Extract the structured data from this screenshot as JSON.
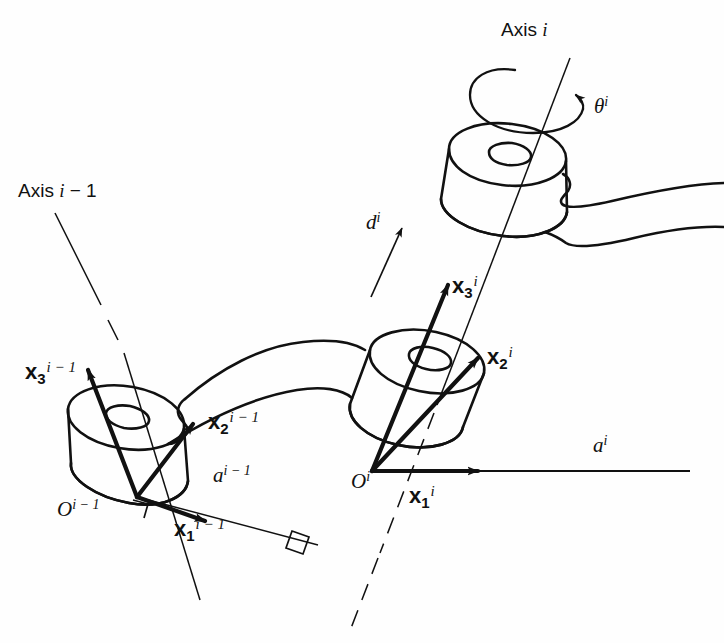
{
  "figure": {
    "type": "diagram",
    "stroke_color": "#111111",
    "background_color": "#fefefe"
  },
  "labels": {
    "axis_prev": {
      "text_prefix": "Axis ",
      "symbol": "i",
      "suffix": " − 1",
      "full": "Axis i − 1"
    },
    "axis_curr": {
      "text_prefix": "Axis ",
      "symbol": "i",
      "suffix": "",
      "full": "Axis i"
    },
    "theta": {
      "glyph": "θ",
      "sup": "i",
      "full": "θⁱ"
    },
    "d_offset": {
      "glyph": "d",
      "sup": "i",
      "full": "dⁱ"
    },
    "a_prev": {
      "glyph": "a",
      "sup": "i − 1",
      "full": "aⁱ⁻¹"
    },
    "a_curr": {
      "glyph": "a",
      "sup": "i",
      "full": "aⁱ"
    },
    "origin_prev": {
      "glyph": "O",
      "sup": "i − 1",
      "full": "Oⁱ⁻¹"
    },
    "origin_curr": {
      "glyph": "O",
      "sup": "i",
      "full": "Oⁱ"
    },
    "x1_prev": {
      "glyph": "x",
      "sub": "1",
      "sup": "i − 1"
    },
    "x2_prev": {
      "glyph": "x",
      "sub": "2",
      "sup": "i − 1"
    },
    "x3_prev": {
      "glyph": "x",
      "sub": "3",
      "sup": "i − 1"
    },
    "x1_curr": {
      "glyph": "x",
      "sub": "1",
      "sup": "i"
    },
    "x2_curr": {
      "glyph": "x",
      "sub": "2",
      "sup": "i"
    },
    "x3_curr": {
      "glyph": "x",
      "sub": "3",
      "sup": "i"
    }
  },
  "elements": {
    "joint_prev": "revolute-joint-cylinder-previous",
    "joint_curr": "revolute-joint-cylinder-current",
    "joint_upper": "revolute-joint-cylinder-upper",
    "link_prev": "link-between-joints",
    "link_curr": "link-outgoing-right",
    "right_angle_1": "perpendicular-marker-at-origin-prev",
    "right_angle_2": "perpendicular-marker-at-axis-i"
  }
}
